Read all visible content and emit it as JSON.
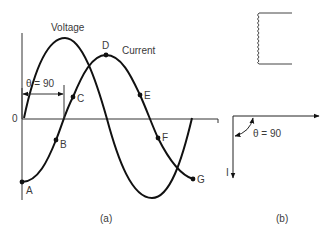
{
  "figure_a": {
    "caption": "(a)",
    "origin_label": "0",
    "voltage_label": "Voltage",
    "current_label": "Current",
    "phase_label": "θ = 90",
    "points": [
      {
        "name": "A",
        "x": 22,
        "y": 182
      },
      {
        "name": "B",
        "x": 56,
        "y": 140
      },
      {
        "name": "C",
        "x": 73,
        "y": 97
      },
      {
        "name": "D",
        "x": 106,
        "y": 55
      },
      {
        "name": "E",
        "x": 140,
        "y": 95
      },
      {
        "name": "F",
        "x": 158,
        "y": 138
      },
      {
        "name": "G",
        "x": 193,
        "y": 179
      }
    ]
  },
  "figure_b": {
    "caption": "(b)",
    "current_phasor_label": "I",
    "angle_label": "θ = 90"
  },
  "colors": {
    "line": "#111111",
    "text": "#3a3a3a",
    "background": "#ffffff"
  }
}
